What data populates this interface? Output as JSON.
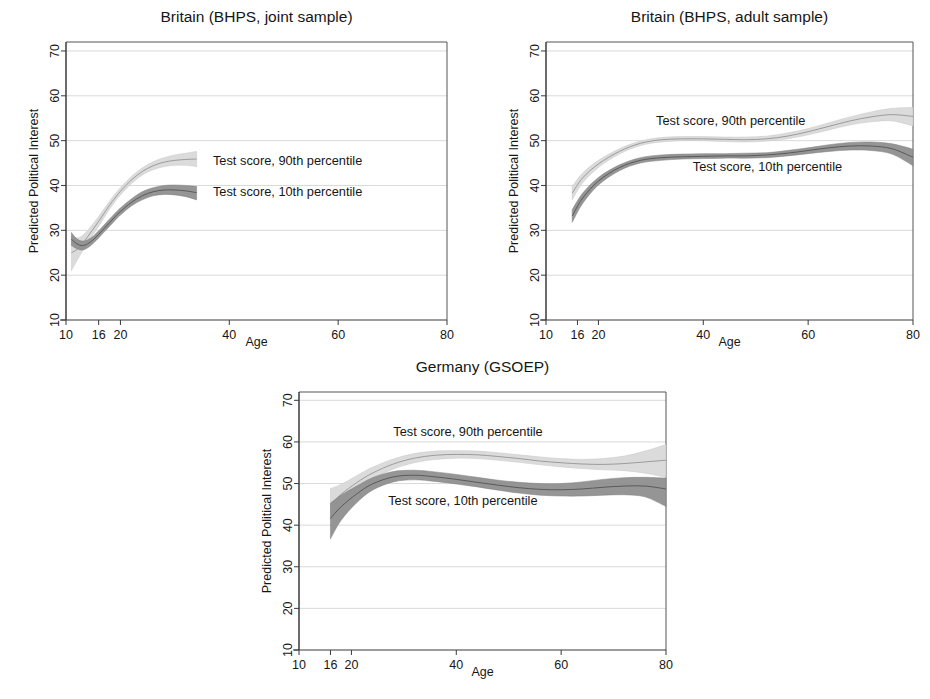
{
  "figure": {
    "kind": "multi-panel-line-chart-with-confidence-bands",
    "panel_count": 3
  },
  "labels": {
    "ylabel": "Predicted Political Interest",
    "xlabel": "Age",
    "series_90": "Test score, 90th percentile",
    "series_10": "Test score, 10th percentile"
  },
  "colors": {
    "band_90_outer": "#d9d9d9",
    "band_90_inner": "#c6c6c6",
    "band_10_outer": "#8f8f8f",
    "band_10_inner": "#7e7e7e",
    "center_line_90": "#8a8a8a",
    "center_line_10": "#4a4a4a",
    "axis": "#3a3a3a",
    "grid": "#c9c9c9",
    "text": "#161616",
    "background": "#ffffff"
  },
  "chart_data": [
    {
      "type": "line",
      "id": "britain-joint",
      "title": "Britain (BHPS, joint sample)",
      "xlabel": "Age",
      "ylabel": "Predicted Political Interest",
      "xlim": [
        10,
        80
      ],
      "ylim": [
        10,
        72
      ],
      "xticks": [
        10,
        16,
        20,
        40,
        60,
        80
      ],
      "yticks": [
        10,
        20,
        30,
        40,
        50,
        60,
        70
      ],
      "grid": true,
      "legend": "inline-annotations",
      "series": [
        {
          "name": "Test score, 90th percentile",
          "x": [
            11,
            12,
            13,
            14,
            15,
            16,
            17,
            18,
            19,
            20,
            22,
            24,
            26,
            28,
            30,
            32,
            34
          ],
          "values": [
            25.0,
            25.7,
            27.0,
            28.6,
            30.3,
            32.0,
            33.8,
            35.6,
            37.2,
            38.7,
            41.2,
            43.1,
            44.4,
            45.2,
            45.6,
            45.8,
            45.9
          ],
          "lower": [
            21.0,
            23.2,
            25.3,
            27.2,
            29.1,
            30.9,
            32.8,
            34.7,
            36.4,
            37.9,
            40.4,
            42.3,
            43.5,
            44.2,
            44.5,
            44.5,
            44.2
          ],
          "upper": [
            28.8,
            28.3,
            28.8,
            30.0,
            31.5,
            33.1,
            34.8,
            36.5,
            38.1,
            39.5,
            42.0,
            43.9,
            45.3,
            46.2,
            46.8,
            47.2,
            47.6
          ]
        },
        {
          "name": "Test score, 10th percentile",
          "x": [
            11,
            12,
            13,
            14,
            15,
            16,
            17,
            18,
            19,
            20,
            22,
            24,
            26,
            28,
            30,
            32,
            34
          ],
          "values": [
            28.0,
            27.0,
            26.6,
            27.0,
            27.9,
            29.1,
            30.4,
            31.7,
            33.0,
            34.2,
            36.2,
            37.7,
            38.6,
            39.0,
            39.0,
            38.8,
            38.4
          ],
          "lower": [
            26.6,
            25.9,
            25.6,
            26.1,
            27.1,
            28.3,
            29.6,
            30.9,
            32.2,
            33.4,
            35.4,
            36.8,
            37.7,
            38.0,
            37.9,
            37.5,
            36.8
          ],
          "upper": [
            29.5,
            28.1,
            27.6,
            27.9,
            28.7,
            29.9,
            31.2,
            32.5,
            33.8,
            35.0,
            37.0,
            38.6,
            39.5,
            40.0,
            40.1,
            40.0,
            39.8
          ]
        }
      ],
      "annotations": [
        {
          "text": "Test score, 90th percentile",
          "x": 37,
          "y": 45.5
        },
        {
          "text": "Test score, 10th percentile",
          "x": 37,
          "y": 38.6
        }
      ]
    },
    {
      "type": "line",
      "id": "britain-adult",
      "title": "Britain (BHPS, adult sample)",
      "xlabel": "Age",
      "ylabel": "Predicted Political Interest",
      "xlim": [
        10,
        80
      ],
      "ylim": [
        10,
        72
      ],
      "xticks": [
        10,
        16,
        20,
        40,
        60,
        80
      ],
      "yticks": [
        10,
        20,
        30,
        40,
        50,
        60,
        70
      ],
      "grid": true,
      "legend": "inline-annotations",
      "series": [
        {
          "name": "Test score, 90th percentile",
          "x": [
            15,
            17,
            20,
            24,
            28,
            32,
            36,
            40,
            44,
            48,
            52,
            56,
            60,
            64,
            68,
            72,
            76,
            80
          ],
          "values": [
            38.3,
            41.7,
            44.8,
            47.6,
            49.4,
            50.2,
            50.4,
            50.4,
            50.3,
            50.2,
            50.4,
            51.0,
            52.0,
            53.2,
            54.4,
            55.3,
            55.8,
            55.4
          ],
          "lower": [
            36.8,
            40.6,
            44.0,
            47.0,
            48.9,
            49.7,
            50.0,
            50.0,
            49.8,
            49.7,
            49.9,
            50.4,
            51.3,
            52.4,
            53.5,
            54.2,
            54.4,
            53.3
          ],
          "upper": [
            39.8,
            42.8,
            45.6,
            48.2,
            49.9,
            50.7,
            50.9,
            50.9,
            50.8,
            50.8,
            51.0,
            51.7,
            52.7,
            54.0,
            55.3,
            56.4,
            57.2,
            57.4
          ]
        },
        {
          "name": "Test score, 10th percentile",
          "x": [
            15,
            17,
            20,
            24,
            28,
            32,
            36,
            40,
            44,
            48,
            52,
            56,
            60,
            64,
            68,
            72,
            76,
            80
          ],
          "values": [
            33.2,
            37.2,
            41.0,
            44.0,
            45.6,
            46.2,
            46.4,
            46.5,
            46.6,
            46.6,
            46.8,
            47.2,
            47.8,
            48.4,
            48.8,
            48.8,
            48.2,
            46.3
          ],
          "lower": [
            31.8,
            36.0,
            40.1,
            43.3,
            45.0,
            45.6,
            45.9,
            46.0,
            46.1,
            46.1,
            46.2,
            46.6,
            47.1,
            47.6,
            47.9,
            47.8,
            47.0,
            44.4
          ],
          "upper": [
            34.6,
            38.3,
            41.8,
            44.6,
            46.2,
            46.8,
            47.0,
            47.1,
            47.1,
            47.2,
            47.3,
            47.8,
            48.4,
            49.1,
            49.6,
            49.7,
            49.3,
            48.1
          ]
        }
      ],
      "annotations": [
        {
          "text": "Test score, 90th percentile",
          "x": 31,
          "y": 54.3
        },
        {
          "text": "Test score, 10th percentile",
          "x": 38,
          "y": 44.2
        }
      ]
    },
    {
      "type": "line",
      "id": "germany",
      "title": "Germany (GSOEP)",
      "xlabel": "Age",
      "ylabel": "Predicted Political Interest",
      "xlim": [
        10,
        80
      ],
      "ylim": [
        10,
        72
      ],
      "xticks": [
        10,
        16,
        20,
        40,
        60,
        80
      ],
      "yticks": [
        10,
        20,
        30,
        40,
        50,
        60,
        70
      ],
      "grid": true,
      "legend": "inline-annotations",
      "series": [
        {
          "name": "Test score, 90th percentile",
          "x": [
            16,
            18,
            21,
            24,
            28,
            32,
            36,
            40,
            44,
            48,
            52,
            56,
            60,
            64,
            68,
            72,
            76,
            80
          ],
          "values": [
            44.9,
            47.4,
            50.2,
            52.5,
            54.7,
            56.1,
            56.8,
            57.0,
            56.9,
            56.5,
            56.0,
            55.4,
            55.0,
            54.7,
            54.6,
            54.8,
            55.2,
            55.6
          ],
          "lower": [
            41.4,
            45.0,
            48.5,
            51.1,
            53.5,
            55.0,
            55.8,
            56.1,
            56.0,
            55.6,
            55.1,
            54.5,
            54.0,
            53.6,
            53.3,
            53.1,
            52.5,
            51.5
          ],
          "upper": [
            48.8,
            49.8,
            51.9,
            53.9,
            55.9,
            57.2,
            57.8,
            57.9,
            57.8,
            57.4,
            56.9,
            56.4,
            56.0,
            55.8,
            56.0,
            56.6,
            57.8,
            59.4
          ]
        },
        {
          "name": "Test score, 10th percentile",
          "x": [
            16,
            18,
            21,
            24,
            28,
            32,
            36,
            40,
            44,
            48,
            52,
            56,
            60,
            64,
            68,
            72,
            76,
            80
          ],
          "values": [
            41.6,
            44.4,
            47.5,
            49.9,
            51.6,
            52.0,
            51.6,
            51.0,
            50.3,
            49.6,
            49.0,
            48.6,
            48.5,
            48.7,
            49.1,
            49.4,
            49.4,
            48.7
          ],
          "lower": [
            36.7,
            41.1,
            45.4,
            48.4,
            50.4,
            50.9,
            50.5,
            49.9,
            49.2,
            48.4,
            47.7,
            47.2,
            47.0,
            47.0,
            47.2,
            47.3,
            46.8,
            44.5
          ],
          "upper": [
            45.3,
            47.2,
            49.4,
            51.4,
            52.9,
            53.2,
            52.8,
            52.2,
            51.5,
            50.8,
            50.3,
            50.0,
            50.0,
            50.4,
            51.0,
            51.4,
            51.5,
            51.3
          ]
        }
      ],
      "annotations": [
        {
          "text": "Test score, 90th percentile",
          "x": 28,
          "y": 62.5
        },
        {
          "text": "Test score, 10th percentile",
          "x": 27,
          "y": 45.8
        }
      ]
    }
  ]
}
